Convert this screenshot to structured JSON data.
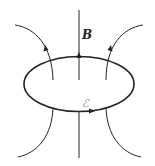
{
  "diagram": {
    "labels": {
      "field": "B",
      "emf": "ℰ"
    },
    "colors": {
      "stroke": "#222222",
      "emf_label": "#999999",
      "background": "#ffffff"
    },
    "elements": [
      {
        "type": "loop",
        "shape": "ellipse",
        "arrow_direction": "counterclockwise-from-front (right at bottom)"
      },
      {
        "type": "field-line",
        "position": "center",
        "direction": "up"
      },
      {
        "type": "field-line",
        "position": "left",
        "direction": "up, flaring out"
      },
      {
        "type": "field-line",
        "position": "right",
        "direction": "up, flaring out"
      }
    ]
  }
}
